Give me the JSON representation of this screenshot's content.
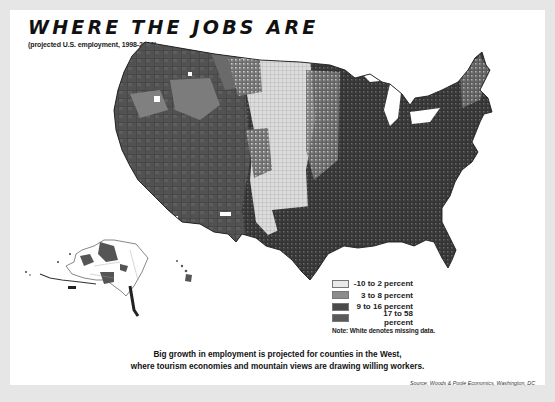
{
  "header": {
    "title": "WHERE THE JOBS ARE",
    "subtitle": "(projected U.S. employment, 1998-2010)"
  },
  "legend": {
    "items": [
      {
        "label": "-10 to 2 percent",
        "color": "#e9e9e9"
      },
      {
        "label": "3 to 8 percent",
        "color": "#8c8c8c"
      },
      {
        "label": "9 to 16 percent",
        "color": "#4a4a4a"
      },
      {
        "label": "17 to 58 percent",
        "color": "#5a5a5a"
      }
    ],
    "note": "Note: White denotes missing data."
  },
  "caption": {
    "line1": "Big growth in employment is projected for counties in the West,",
    "line2": "where tourism economies and mountain views are drawing willing workers."
  },
  "source": "Source: Woods & Poole Economics, Washington, DC",
  "map": {
    "region": "United States (counties)",
    "insets": [
      "Alaska",
      "Hawaii"
    ],
    "regional_pattern": {
      "West": "17 to 58 percent",
      "Great Plains": "-10 to 2 percent",
      "Midwest/East": "9 to 16 percent",
      "Southeast": "9 to 16 percent"
    },
    "colors": {
      "background": "#e6e6e6",
      "panel": "#ffffff",
      "border": "#2a2a2a"
    }
  }
}
